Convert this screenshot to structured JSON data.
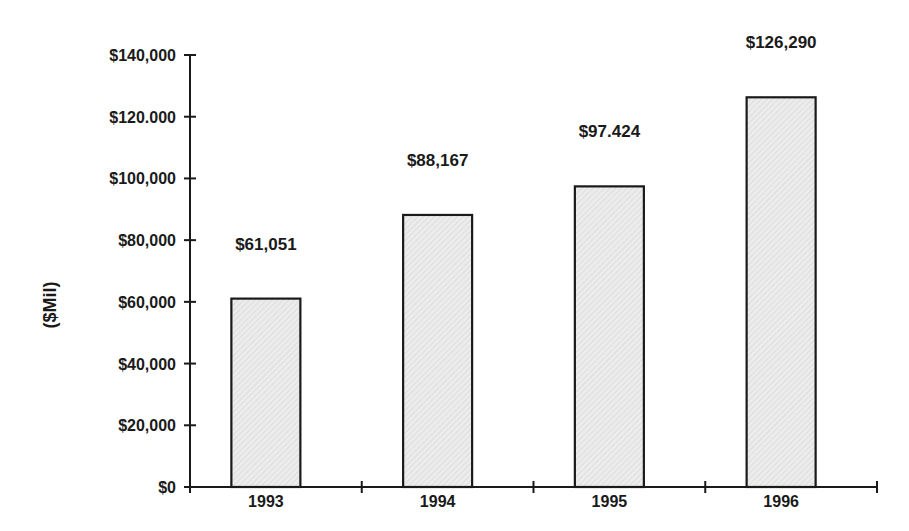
{
  "chart_data": {
    "type": "bar",
    "title": "",
    "xlabel": "",
    "ylabel": "($Mil)",
    "categories": [
      "1993",
      "1994",
      "1995",
      "1996"
    ],
    "values": [
      61051,
      88167,
      97424,
      126290
    ],
    "data_labels": [
      "$61,051",
      "$88,167",
      "$97.424",
      "$126,290"
    ],
    "ylim": [
      0,
      140000
    ],
    "y_ticks": [
      0,
      20000,
      40000,
      60000,
      80000,
      100000,
      120000,
      140000
    ],
    "y_tick_labels": [
      "$0",
      "$20,000",
      "$40,000",
      "$60,000",
      "$80,000",
      "$100,000",
      "$120.000",
      "$140,000"
    ],
    "grid": false,
    "legend": "none",
    "bar_fill": "#e6e6e6",
    "bar_edge": "#1a1a1a"
  }
}
